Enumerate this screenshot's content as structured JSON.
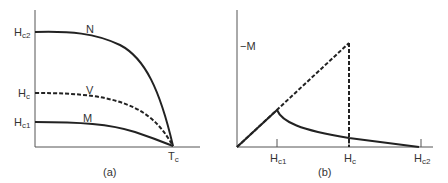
{
  "panel_a": {
    "caption": "(a)",
    "y_labels": {
      "hc2": {
        "main": "H",
        "sub": "c2"
      },
      "hc": {
        "main": "H",
        "sub": "c"
      },
      "hc1": {
        "main": "H",
        "sub": "c1"
      }
    },
    "x_label": {
      "main": "T",
      "sub": "c"
    },
    "curve_labels": {
      "n": "N",
      "v": "V",
      "m": "M"
    }
  },
  "panel_b": {
    "caption": "(b)",
    "y_label": "−M",
    "x_labels": {
      "hc1": {
        "main": "H",
        "sub": "c1"
      },
      "hc": {
        "main": "H",
        "sub": "c"
      },
      "hc2": {
        "main": "H",
        "sub": "c2"
      }
    }
  }
}
